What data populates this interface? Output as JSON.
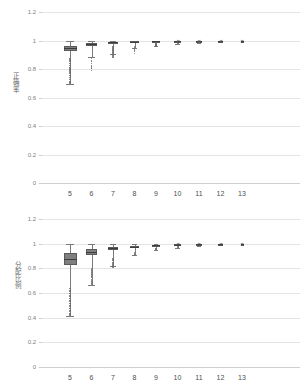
{
  "figure": {
    "background": "#ffffff",
    "box_fill": "#7f7f7f",
    "box_stroke": "#5a5a5a",
    "grid_color": "#e4e4e4",
    "outlier_color": "#6e6e6e"
  },
  "chart_data": [
    {
      "id": "top",
      "type": "box",
      "title": "",
      "xlabel": "",
      "ylabel": "正确率",
      "categories": [
        "5",
        "6",
        "7",
        "8",
        "9",
        "10",
        "11",
        "12",
        "13"
      ],
      "yticks": [
        "1.2",
        "1",
        "0.8",
        "0.6",
        "0.4",
        "0.2",
        "0"
      ],
      "ylim": [
        0,
        1.2
      ],
      "grid": true,
      "legend": "none",
      "boxes": [
        {
          "category": "5",
          "min": 0.695,
          "q1": 0.925,
          "median": 0.945,
          "q3": 0.963,
          "max": 1.0,
          "outliers": [
            0.87,
            0.855,
            0.84,
            0.825,
            0.81,
            0.8,
            0.785,
            0.77,
            0.755,
            0.74,
            0.725,
            0.71,
            0.7
          ]
        },
        {
          "category": "6",
          "min": 0.885,
          "q1": 0.962,
          "median": 0.972,
          "q3": 0.98,
          "max": 1.0,
          "outliers": [
            0.875,
            0.855,
            0.838,
            0.822,
            0.805,
            0.79
          ]
        },
        {
          "category": "7",
          "min": 0.905,
          "q1": 0.98,
          "median": 0.986,
          "q3": 0.991,
          "max": 1.0,
          "outliers": [
            0.955,
            0.945,
            0.935,
            0.925,
            0.915,
            0.905,
            0.895,
            0.885
          ]
        },
        {
          "category": "8",
          "min": 0.945,
          "q1": 0.987,
          "median": 0.991,
          "q3": 0.995,
          "max": 1.0,
          "outliers": [
            0.958,
            0.946,
            0.934,
            0.922,
            0.91
          ]
        },
        {
          "category": "9",
          "min": 0.958,
          "q1": 0.992,
          "median": 0.995,
          "q3": 0.997,
          "max": 1.0,
          "outliers": [
            0.984,
            0.977,
            0.97,
            0.963
          ]
        },
        {
          "category": "10",
          "min": 0.975,
          "q1": 0.995,
          "median": 0.997,
          "q3": 0.999,
          "max": 1.0,
          "outliers": [
            0.988,
            0.982
          ]
        },
        {
          "category": "11",
          "min": 0.985,
          "q1": 0.997,
          "median": 0.999,
          "q3": 1.0,
          "max": 1.0,
          "outliers": [
            0.991
          ]
        },
        {
          "category": "12",
          "min": 0.99,
          "q1": 0.998,
          "median": 1.0,
          "q3": 1.0,
          "max": 1.0,
          "outliers": [
            0.993
          ]
        },
        {
          "category": "13",
          "min": 0.995,
          "q1": 1.0,
          "median": 1.0,
          "q3": 1.0,
          "max": 1.0,
          "outliers": []
        }
      ]
    },
    {
      "id": "bottom",
      "type": "box",
      "title": "",
      "xlabel": "",
      "ylabel": "分配比例",
      "categories": [
        "5",
        "6",
        "7",
        "8",
        "9",
        "10",
        "11",
        "12",
        "13"
      ],
      "yticks": [
        "1.2",
        "1",
        "0.8",
        "0.6",
        "0.4",
        "0.2",
        "0"
      ],
      "ylim": [
        0,
        1.2
      ],
      "grid": true,
      "legend": "none",
      "boxes": [
        {
          "category": "5",
          "min": 0.415,
          "q1": 0.825,
          "median": 0.878,
          "q3": 0.925,
          "max": 1.0,
          "outliers": [
            0.635,
            0.615,
            0.595,
            0.575,
            0.555,
            0.535,
            0.515,
            0.495,
            0.475,
            0.455,
            0.435,
            0.42
          ]
        },
        {
          "category": "6",
          "min": 0.665,
          "q1": 0.905,
          "median": 0.935,
          "q3": 0.955,
          "max": 1.0,
          "outliers": [
            0.8,
            0.785,
            0.77,
            0.755,
            0.74,
            0.725,
            0.71,
            0.695,
            0.68,
            0.665
          ]
        },
        {
          "category": "7",
          "min": 0.815,
          "q1": 0.948,
          "median": 0.962,
          "q3": 0.972,
          "max": 1.0,
          "outliers": [
            0.875,
            0.862,
            0.848,
            0.835,
            0.822,
            0.812
          ]
        },
        {
          "category": "8",
          "min": 0.905,
          "q1": 0.966,
          "median": 0.975,
          "q3": 0.983,
          "max": 1.0,
          "outliers": [
            0.928,
            0.918,
            0.908
          ]
        },
        {
          "category": "9",
          "min": 0.945,
          "q1": 0.982,
          "median": 0.988,
          "q3": 0.992,
          "max": 1.0,
          "outliers": [
            0.962,
            0.952
          ]
        },
        {
          "category": "10",
          "min": 0.968,
          "q1": 0.99,
          "median": 0.993,
          "q3": 0.996,
          "max": 1.0,
          "outliers": [
            0.975
          ]
        },
        {
          "category": "11",
          "min": 0.982,
          "q1": 0.995,
          "median": 0.997,
          "q3": 0.999,
          "max": 1.0,
          "outliers": []
        },
        {
          "category": "12",
          "min": 0.99,
          "q1": 0.998,
          "median": 1.0,
          "q3": 1.0,
          "max": 1.0,
          "outliers": []
        },
        {
          "category": "13",
          "min": 0.996,
          "q1": 1.0,
          "median": 1.0,
          "q3": 1.0,
          "max": 1.0,
          "outliers": []
        }
      ]
    }
  ]
}
